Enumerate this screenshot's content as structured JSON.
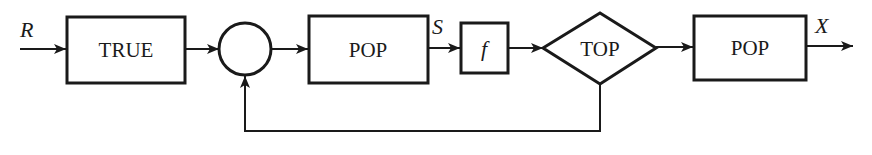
{
  "diagram": {
    "type": "block-diagram-feedback-loop",
    "signals": {
      "input": "R",
      "intermediate": "S",
      "output": "X"
    },
    "blocks": [
      {
        "id": "true-block",
        "shape": "rectangle",
        "label": "TRUE"
      },
      {
        "id": "summing-junction",
        "shape": "circle",
        "label": ""
      },
      {
        "id": "pop-block-1",
        "shape": "rectangle",
        "label": "POP"
      },
      {
        "id": "f-block",
        "shape": "rectangle",
        "label": "f"
      },
      {
        "id": "top-decision",
        "shape": "diamond",
        "label": "TOP"
      },
      {
        "id": "pop-block-2",
        "shape": "rectangle",
        "label": "POP"
      }
    ],
    "connections": [
      {
        "from": "R",
        "to": "true-block"
      },
      {
        "from": "true-block",
        "to": "summing-junction"
      },
      {
        "from": "summing-junction",
        "to": "pop-block-1"
      },
      {
        "from": "pop-block-1",
        "to": "f-block",
        "label": "S"
      },
      {
        "from": "f-block",
        "to": "top-decision"
      },
      {
        "from": "top-decision",
        "to": "pop-block-2"
      },
      {
        "from": "pop-block-2",
        "to": "X",
        "label": "X"
      },
      {
        "from": "top-decision",
        "to": "summing-junction",
        "kind": "feedback"
      }
    ],
    "colors": {
      "line": "#1a1a1a",
      "background": "#ffffff"
    }
  }
}
